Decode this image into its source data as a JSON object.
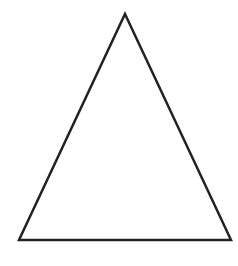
{
  "diagram": {
    "type": "triangle",
    "shape": "isosceles-triangle",
    "background_color": "#ffffff",
    "stroke_color": "#222222",
    "fill_color": "none",
    "stroke_width": 2.5,
    "vertices": {
      "apex": [
        125,
        14
      ],
      "bottom_left": [
        19,
        240
      ],
      "bottom_right": [
        231,
        240
      ]
    }
  }
}
